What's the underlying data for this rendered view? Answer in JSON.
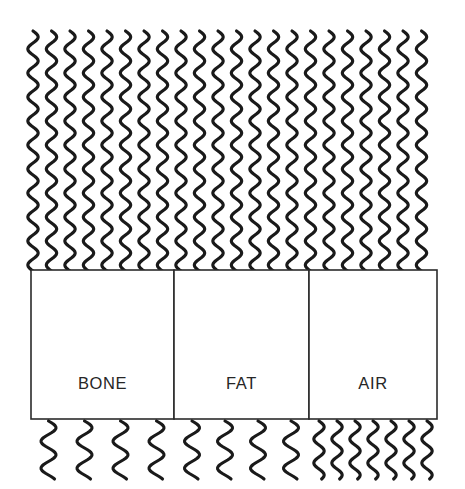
{
  "figure": {
    "type": "diagram",
    "width": 465,
    "height": 489,
    "background_color": "#ffffff",
    "stroke_color": "#1a1a1a",
    "box_stroke_color": "#2b2b2b",
    "label_color": "#262626"
  },
  "incident_region": {
    "name": "incident-waves",
    "x": 33,
    "y": 31,
    "width": 404,
    "height": 240,
    "wave_count": 22,
    "wave_spacing": 18.5,
    "wave_period": 24,
    "wave_amplitude": 5.2,
    "description": "dense uniform vertical sinusoidal waves travelling downward"
  },
  "materials": {
    "box_top": 270,
    "box_bottom": 419,
    "box_left": 31,
    "box_right": 437,
    "label_baseline": 389,
    "items": [
      {
        "label": "BONE",
        "x": 31,
        "width": 143,
        "transmitted_wave_count": 4,
        "transmitted_wave_spacing": 36,
        "transmitted_wave_amplitude": 7.5,
        "transmitted_wave_period": 27
      },
      {
        "label": "FAT",
        "x": 174,
        "width": 135,
        "transmitted_wave_count": 4,
        "transmitted_wave_spacing": 33,
        "transmitted_wave_amplitude": 7.5,
        "transmitted_wave_period": 27
      },
      {
        "label": "AIR",
        "x": 309,
        "width": 128,
        "transmitted_wave_count": 7,
        "transmitted_wave_spacing": 18,
        "transmitted_wave_amplitude": 5.2,
        "transmitted_wave_period": 24
      }
    ]
  },
  "transmitted_region": {
    "name": "transmitted-waves",
    "y": 421,
    "height": 58,
    "description": "waves emerging below each material block; spacing differs per material"
  }
}
